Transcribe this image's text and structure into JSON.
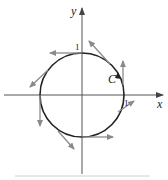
{
  "diagram": {
    "type": "vector-field-on-circle",
    "axes": {
      "x_label": "x",
      "y_label": "y",
      "tick_x": "1",
      "tick_y": "1"
    },
    "curve": {
      "label": "C",
      "shape": "unit circle",
      "orientation": "counterclockwise"
    },
    "colors": {
      "axis": "#555555",
      "curve": "#222222",
      "vectors": "#8a8a8a"
    },
    "vectors": [
      {
        "at": "top (0,1)",
        "direction": "left"
      },
      {
        "at": "upper-right",
        "direction": "up-left"
      },
      {
        "at": "right above C",
        "direction": "up"
      },
      {
        "at": "right (1,0)",
        "direction": "up-right"
      },
      {
        "at": "bottom (0,-1)",
        "direction": "right"
      },
      {
        "at": "lower-left",
        "direction": "down-right"
      },
      {
        "at": "left (-1,0)",
        "direction": "down"
      },
      {
        "at": "upper-left",
        "direction": "down-left"
      }
    ]
  }
}
